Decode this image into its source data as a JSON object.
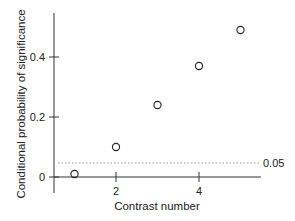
{
  "chart_data": {
    "type": "scatter",
    "title": "",
    "xlabel": "Contrast number",
    "ylabel": "Conditional probability of significance",
    "x": [
      1,
      2,
      3,
      4,
      5
    ],
    "y": [
      0.01,
      0.1,
      0.24,
      0.37,
      0.49
    ],
    "xticks": [
      2,
      4
    ],
    "xtick_labels": [
      "2",
      "4"
    ],
    "yticks": [
      0,
      0.2,
      0.4
    ],
    "ytick_labels": [
      "0",
      "0.2",
      "0.4"
    ],
    "xlim": [
      0.6,
      5.6
    ],
    "ylim": [
      -0.02,
      0.55
    ],
    "grid": false,
    "legend": null,
    "marker": "open-circle",
    "reference_line": {
      "y": 0.05,
      "style": "dotted",
      "label": "0.05"
    },
    "colors": {
      "marker": "#222222",
      "axis": "#333333",
      "reference": "#999999"
    }
  }
}
